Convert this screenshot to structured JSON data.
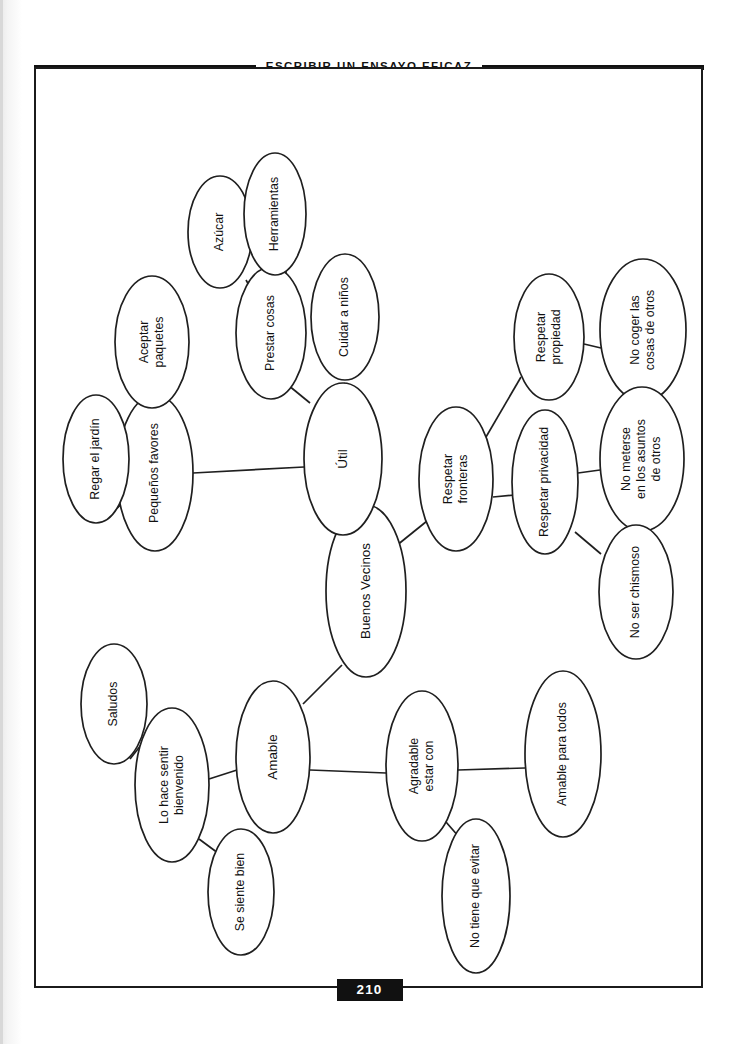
{
  "header": {
    "running_head": "ESCRIBIR UN ENSAYO EFICAZ"
  },
  "footer": {
    "page_number": "210"
  },
  "chart_data": {
    "type": "diagram",
    "subtype": "concept-map",
    "title": "Buenos Vecinos",
    "orientation": "rotated-90-ccw",
    "root": "n_center",
    "nodes": [
      {
        "id": "n_center",
        "label": "Buenos Vecinos",
        "lines": [
          "Buenos Vecinos"
        ],
        "cx": 332,
        "cy": 524,
        "rx": 40,
        "ry": 86,
        "size": "big"
      },
      {
        "id": "n_util",
        "label": "Útil",
        "lines": [
          "Útil"
        ],
        "cx": 309,
        "cy": 392,
        "rx": 39,
        "ry": 76,
        "size": "big"
      },
      {
        "id": "n_prestar",
        "label": "Prestar cosas",
        "lines": [
          "Prestar cosas"
        ],
        "cx": 237,
        "cy": 266,
        "rx": 35,
        "ry": 66,
        "size": "normal"
      },
      {
        "id": "n_azucar",
        "label": "Azúcar",
        "lines": [
          "Azúcar"
        ],
        "cx": 186,
        "cy": 165,
        "rx": 32,
        "ry": 56,
        "size": "normal"
      },
      {
        "id": "n_herram",
        "label": "Herramientas",
        "lines": [
          "Herramientas"
        ],
        "cx": 241,
        "cy": 147,
        "rx": 31,
        "ry": 61,
        "size": "normal"
      },
      {
        "id": "n_cuidar",
        "label": "Cuidar a niños",
        "lines": [
          "Cuidar a niños"
        ],
        "cx": 311,
        "cy": 250,
        "rx": 34,
        "ry": 63,
        "size": "normal"
      },
      {
        "id": "n_peq",
        "label": "Pequeños favores",
        "lines": [
          "Pequeños favores"
        ],
        "cx": 121,
        "cy": 406,
        "rx": 38,
        "ry": 78,
        "size": "normal"
      },
      {
        "id": "n_aceptar",
        "label": "Aceptar paquetes",
        "lines": [
          "Aceptar",
          "paquetes"
        ],
        "cx": 118,
        "cy": 275,
        "rx": 37,
        "ry": 66,
        "size": "normal"
      },
      {
        "id": "n_regar",
        "label": "Regar el jardín",
        "lines": [
          "Regar el jardín"
        ],
        "cx": 62,
        "cy": 392,
        "rx": 33,
        "ry": 64,
        "size": "normal"
      },
      {
        "id": "n_front",
        "label": "Respetar fronteras",
        "lines": [
          "Respetar",
          "fronteras"
        ],
        "cx": 422,
        "cy": 412,
        "rx": 37,
        "ry": 72,
        "size": "normal"
      },
      {
        "id": "n_prop",
        "label": "Respetar propiedad",
        "lines": [
          "Respetar",
          "propiedad"
        ],
        "cx": 515,
        "cy": 270,
        "rx": 35,
        "ry": 63,
        "size": "normal"
      },
      {
        "id": "n_nocoger",
        "label": "No coger las cosas de otros",
        "lines": [
          "No coger las",
          "cosas de otros"
        ],
        "cx": 609,
        "cy": 263,
        "rx": 43,
        "ry": 71,
        "size": "normal"
      },
      {
        "id": "n_priv",
        "label": "Respetar privacidad",
        "lines": [
          "Respetar privacidad"
        ],
        "cx": 511,
        "cy": 415,
        "rx": 33,
        "ry": 72,
        "size": "normal"
      },
      {
        "id": "n_nometer",
        "label": "No meterse en los asuntos de otros",
        "lines": [
          "No meterse",
          "en los asuntos",
          "de otros"
        ],
        "cx": 608,
        "cy": 392,
        "rx": 42,
        "ry": 72,
        "size": "normal"
      },
      {
        "id": "n_chismoso",
        "label": "No ser chismoso",
        "lines": [
          "No ser chismoso"
        ],
        "cx": 602,
        "cy": 525,
        "rx": 37,
        "ry": 67,
        "size": "normal"
      },
      {
        "id": "n_amable",
        "label": "Amable",
        "lines": [
          "Amable"
        ],
        "cx": 239,
        "cy": 690,
        "rx": 37,
        "ry": 76,
        "size": "big"
      },
      {
        "id": "n_bienv",
        "label": "Lo hace sentir bienvenido",
        "lines": [
          "Lo hace sentir",
          "bienvenido"
        ],
        "cx": 138,
        "cy": 718,
        "rx": 37,
        "ry": 77,
        "size": "normal"
      },
      {
        "id": "n_saludos",
        "label": "Saludos",
        "lines": [
          "Saludos"
        ],
        "cx": 80,
        "cy": 637,
        "rx": 33,
        "ry": 60,
        "size": "normal"
      },
      {
        "id": "n_siente",
        "label": "Se siente bien",
        "lines": [
          "Se siente bien"
        ],
        "cx": 207,
        "cy": 825,
        "rx": 33,
        "ry": 63,
        "size": "normal"
      },
      {
        "id": "n_agrad",
        "label": "Agradable estar con",
        "lines": [
          "Agradable",
          "estar con"
        ],
        "cx": 388,
        "cy": 699,
        "rx": 36,
        "ry": 75,
        "size": "normal"
      },
      {
        "id": "n_amtodos",
        "label": "Amable para todos",
        "lines": [
          "Amable para todos"
        ],
        "cx": 529,
        "cy": 687,
        "rx": 38,
        "ry": 83,
        "size": "normal"
      },
      {
        "id": "n_noevitar",
        "label": "No tiene que evitar",
        "lines": [
          "No tiene que evitar"
        ],
        "cx": 442,
        "cy": 829,
        "rx": 34,
        "ry": 77,
        "size": "normal"
      }
    ],
    "edges": [
      {
        "from": "n_center",
        "to": "n_util",
        "x1": 314,
        "y1": 446,
        "x2": 305,
        "y2": 469
      },
      {
        "from": "n_center",
        "to": "n_front",
        "x1": 362,
        "y1": 479,
        "x2": 398,
        "y2": 450
      },
      {
        "from": "n_center",
        "to": "n_amable",
        "x1": 269,
        "y1": 637,
        "x2": 308,
        "y2": 598
      },
      {
        "from": "n_util",
        "to": "n_prestar",
        "x1": 276,
        "y1": 336,
        "x2": 254,
        "y2": 318
      },
      {
        "from": "n_util",
        "to": "n_cuidar",
        "x1": 311,
        "y1": 316,
        "x2": 300,
        "y2": 338
      },
      {
        "from": "n_util",
        "to": "n_peq",
        "x1": 159,
        "y1": 406,
        "x2": 270,
        "y2": 400
      },
      {
        "from": "n_prestar",
        "to": "n_azucar",
        "x1": 212,
        "y1": 213,
        "x2": 221,
        "y2": 229
      },
      {
        "from": "n_prestar",
        "to": "n_herram",
        "x1": 252,
        "y1": 204,
        "x2": 252,
        "y2": 221
      },
      {
        "from": "n_peq",
        "to": "n_aceptar",
        "x1": 126,
        "y1": 341,
        "x2": 130,
        "y2": 360
      },
      {
        "from": "n_peq",
        "to": "n_regar",
        "x1": 95,
        "y1": 430,
        "x2": 83,
        "y2": 441
      },
      {
        "from": "n_front",
        "to": "n_prop",
        "x1": 452,
        "y1": 370,
        "x2": 487,
        "y2": 310
      },
      {
        "from": "n_front",
        "to": "n_priv",
        "x1": 459,
        "y1": 430,
        "x2": 481,
        "y2": 428
      },
      {
        "from": "n_prop",
        "to": "n_nocoger",
        "x1": 550,
        "y1": 277,
        "x2": 567,
        "y2": 281
      },
      {
        "from": "n_priv",
        "to": "n_nometer",
        "x1": 544,
        "y1": 406,
        "x2": 566,
        "y2": 403
      },
      {
        "from": "n_priv",
        "to": "n_chismoso",
        "x1": 541,
        "y1": 465,
        "x2": 567,
        "y2": 487
      },
      {
        "from": "n_amable",
        "to": "n_bienv",
        "x1": 203,
        "y1": 703,
        "x2": 175,
        "y2": 712
      },
      {
        "from": "n_amable",
        "to": "n_agrad",
        "x1": 276,
        "y1": 703,
        "x2": 352,
        "y2": 706
      },
      {
        "from": "n_bienv",
        "to": "n_saludos",
        "x1": 111,
        "y1": 673,
        "x2": 96,
        "y2": 692
      },
      {
        "from": "n_bienv",
        "to": "n_siente",
        "x1": 165,
        "y1": 772,
        "x2": 188,
        "y2": 789
      },
      {
        "from": "n_agrad",
        "to": "n_amtodos",
        "x1": 424,
        "y1": 703,
        "x2": 491,
        "y2": 701
      },
      {
        "from": "n_agrad",
        "to": "n_noevitar",
        "x1": 412,
        "y1": 755,
        "x2": 432,
        "y2": 778
      }
    ]
  }
}
